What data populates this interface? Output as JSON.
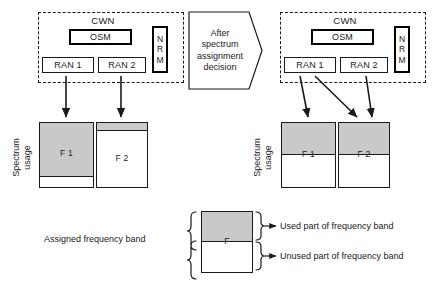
{
  "figure": {
    "left_panel": {
      "network_title": "CWN",
      "osm_label": "OSM",
      "nrm_letters": [
        "N",
        "R",
        "M"
      ],
      "ran1_label": "RAN 1",
      "ran2_label": "RAN 2",
      "axis_label_line1": "Spectrum",
      "axis_label_line2": "usage",
      "bands": [
        {
          "label": "F 1",
          "used_fraction": 0.85
        },
        {
          "label": "F 2",
          "used_fraction": 0.12
        }
      ]
    },
    "transition": {
      "line1": "After",
      "line2": "spectrum",
      "line3": "assignment",
      "line4": "decision"
    },
    "right_panel": {
      "network_title": "CWN",
      "osm_label": "OSM",
      "nrm_letters": [
        "N",
        "R",
        "M"
      ],
      "ran1_label": "RAN 1",
      "ran2_label": "RAN 2",
      "axis_label_line1": "Spectrum",
      "axis_label_line2": "usage",
      "bands": [
        {
          "label": "F 1",
          "used_fraction": 0.5
        },
        {
          "label": "F 2",
          "used_fraction": 0.5
        }
      ]
    },
    "legend": {
      "assigned_label": "Assigned frequency band",
      "band_label": "F",
      "used_label": "Used part of frequency band",
      "unused_label": "Unused part of frequency band",
      "used_fraction": 0.5
    },
    "colors": {
      "used_fill": "#c9c9c9",
      "unused_fill": "#ffffff",
      "stroke": "#1a1a1a"
    }
  }
}
